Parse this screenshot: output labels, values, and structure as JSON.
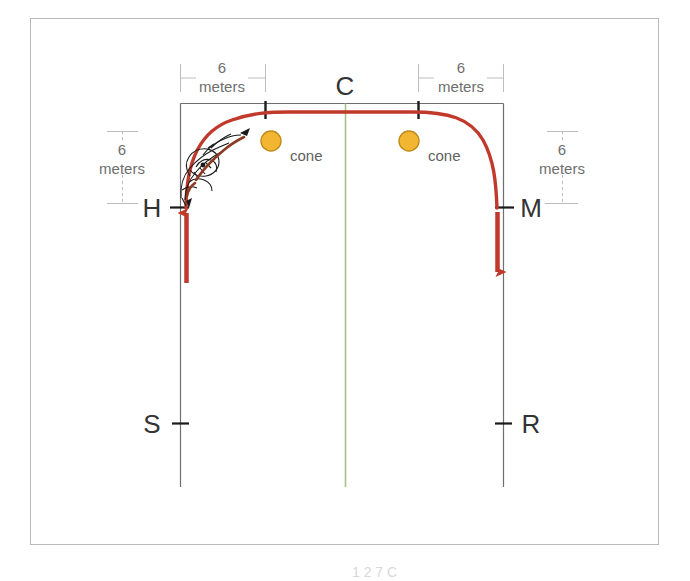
{
  "figure": {
    "frame": {
      "stroke": "#b9b9b9",
      "x": 30,
      "y": 18,
      "width": 628,
      "height": 526
    },
    "arena": {
      "stroke": "#6e6e6e",
      "left_x": 180,
      "right_x": 503,
      "top_y": 103,
      "bottom_y": 487
    },
    "center_line": {
      "color": "#a7c08a",
      "x": 345,
      "top_y": 103,
      "bottom_y": 487
    },
    "path": {
      "color": "#c0392b",
      "stroke_width": 3.2,
      "description": "red track path from H up and around the top corners to M"
    },
    "cone_color": "#f2b632",
    "cone_stroke": "#c08a18"
  },
  "letters": [
    {
      "id": "C",
      "label": "C",
      "x": 345,
      "y": 86,
      "anchor": "middle"
    },
    {
      "id": "H",
      "label": "H",
      "x": 152,
      "y": 214,
      "anchor": "middle"
    },
    {
      "id": "M",
      "label": "M",
      "x": 531,
      "y": 214,
      "anchor": "middle"
    },
    {
      "id": "S",
      "label": "S",
      "x": 152,
      "y": 430,
      "anchor": "middle"
    },
    {
      "id": "R",
      "label": "R",
      "x": 531,
      "y": 430,
      "anchor": "middle"
    }
  ],
  "dimensions": [
    {
      "id": "top-left",
      "value": "6",
      "unit": "meters",
      "value_x": 222,
      "value_y": 72,
      "unit_x": 222,
      "unit_y": 91,
      "orientation": "horizontal",
      "line_y": 78,
      "line_x1": 180,
      "line_x2": 265
    },
    {
      "id": "top-right",
      "value": "6",
      "unit": "meters",
      "value_x": 461,
      "value_y": 72,
      "unit_x": 461,
      "unit_y": 91,
      "orientation": "horizontal",
      "line_y": 78,
      "line_x1": 418,
      "line_x2": 503
    },
    {
      "id": "left-vertical",
      "value": "6",
      "unit": "meters",
      "value_x": 122,
      "value_y": 150,
      "unit_x": 122,
      "unit_y": 169,
      "orientation": "vertical",
      "line_x": 122,
      "line_y1": 131,
      "line_y2": 203
    },
    {
      "id": "right-vertical",
      "value": "6",
      "unit": "meters",
      "value_x": 562,
      "value_y": 150,
      "unit_x": 562,
      "unit_y": 169,
      "orientation": "vertical",
      "line_x": 562,
      "line_y1": 131,
      "line_y2": 203
    }
  ],
  "cones": [
    {
      "id": "cone-left",
      "label": "cone",
      "cx": 271,
      "cy": 141,
      "r": 10,
      "label_x": 290,
      "label_y": 161
    },
    {
      "id": "cone-right",
      "label": "cone",
      "cx": 409,
      "cy": 141,
      "r": 10,
      "label_x": 428,
      "label_y": 161
    }
  ],
  "arrows": [
    {
      "id": "arrow-up-h",
      "direction": "up",
      "x": 186,
      "from_y": 283,
      "to_y": 207
    },
    {
      "id": "arrow-down-m",
      "direction": "down",
      "x": 497,
      "from_y": 211,
      "to_y": 280
    }
  ],
  "caption_fragment": "1 2 7  C"
}
